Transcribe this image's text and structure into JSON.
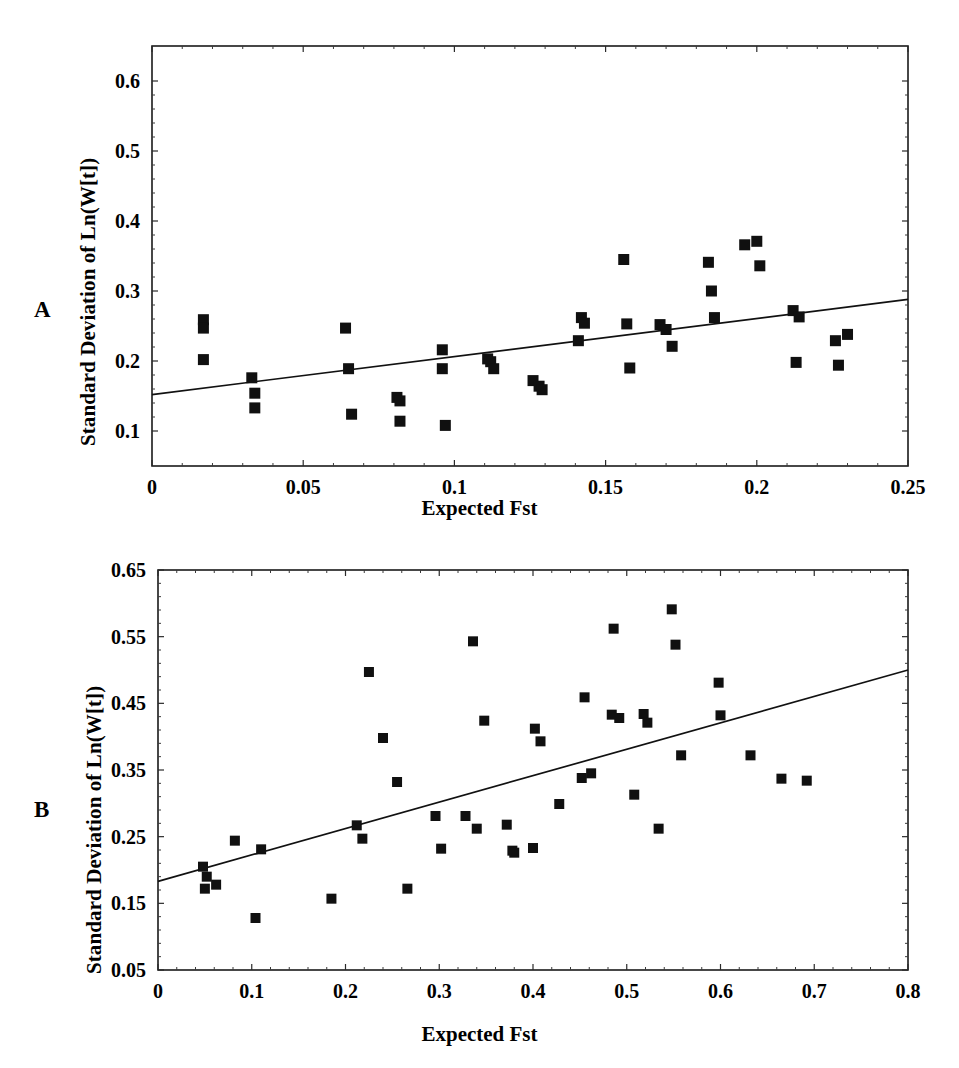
{
  "figure": {
    "panels": [
      {
        "letter": "A",
        "id": "panel-a"
      },
      {
        "letter": "B",
        "id": "panel-b"
      }
    ]
  },
  "chart_data": [
    {
      "type": "scatter",
      "panel_label": "A",
      "title": "",
      "xlabel": "Expected Fst",
      "ylabel": "Standard Deviation of Ln(W[t])",
      "xlim": [
        0,
        0.25
      ],
      "ylim": [
        0.05,
        0.65
      ],
      "xticks": [
        "0",
        "0.05",
        "0.1",
        "0.15",
        "0.2",
        "0.25"
      ],
      "xtick_values": [
        0,
        0.05,
        0.1,
        0.15,
        0.2,
        0.25
      ],
      "yticks": [
        "0.1",
        "0.2",
        "0.3",
        "0.4",
        "0.5",
        "0.6"
      ],
      "ytick_values": [
        0.1,
        0.2,
        0.3,
        0.4,
        0.5,
        0.6
      ],
      "grid": false,
      "legend": "none",
      "marker": "filled-square",
      "trendline": {
        "x": [
          0,
          0.25
        ],
        "y": [
          0.152,
          0.288
        ]
      },
      "points": [
        {
          "x": 0.017,
          "y": 0.259
        },
        {
          "x": 0.017,
          "y": 0.247
        },
        {
          "x": 0.017,
          "y": 0.202
        },
        {
          "x": 0.033,
          "y": 0.176
        },
        {
          "x": 0.034,
          "y": 0.154
        },
        {
          "x": 0.034,
          "y": 0.133
        },
        {
          "x": 0.064,
          "y": 0.247
        },
        {
          "x": 0.065,
          "y": 0.189
        },
        {
          "x": 0.066,
          "y": 0.124
        },
        {
          "x": 0.081,
          "y": 0.148
        },
        {
          "x": 0.082,
          "y": 0.143
        },
        {
          "x": 0.082,
          "y": 0.114
        },
        {
          "x": 0.096,
          "y": 0.216
        },
        {
          "x": 0.096,
          "y": 0.189
        },
        {
          "x": 0.097,
          "y": 0.108
        },
        {
          "x": 0.111,
          "y": 0.203
        },
        {
          "x": 0.112,
          "y": 0.199
        },
        {
          "x": 0.113,
          "y": 0.189
        },
        {
          "x": 0.126,
          "y": 0.172
        },
        {
          "x": 0.128,
          "y": 0.164
        },
        {
          "x": 0.129,
          "y": 0.159
        },
        {
          "x": 0.141,
          "y": 0.229
        },
        {
          "x": 0.142,
          "y": 0.262
        },
        {
          "x": 0.143,
          "y": 0.254
        },
        {
          "x": 0.156,
          "y": 0.345
        },
        {
          "x": 0.157,
          "y": 0.253
        },
        {
          "x": 0.158,
          "y": 0.19
        },
        {
          "x": 0.168,
          "y": 0.252
        },
        {
          "x": 0.17,
          "y": 0.245
        },
        {
          "x": 0.172,
          "y": 0.221
        },
        {
          "x": 0.184,
          "y": 0.341
        },
        {
          "x": 0.185,
          "y": 0.3
        },
        {
          "x": 0.186,
          "y": 0.262
        },
        {
          "x": 0.196,
          "y": 0.366
        },
        {
          "x": 0.2,
          "y": 0.371
        },
        {
          "x": 0.201,
          "y": 0.336
        },
        {
          "x": 0.212,
          "y": 0.272
        },
        {
          "x": 0.214,
          "y": 0.263
        },
        {
          "x": 0.213,
          "y": 0.198
        },
        {
          "x": 0.226,
          "y": 0.229
        },
        {
          "x": 0.227,
          "y": 0.194
        },
        {
          "x": 0.23,
          "y": 0.238
        }
      ]
    },
    {
      "type": "scatter",
      "panel_label": "B",
      "title": "",
      "xlabel": "Expected Fst",
      "ylabel": "Standard Deviation of Ln(W[t])",
      "xlim": [
        0,
        0.8
      ],
      "ylim": [
        0.05,
        0.65
      ],
      "xticks": [
        "0",
        "0.1",
        "0.2",
        "0.3",
        "0.4",
        "0.5",
        "0.6",
        "0.7",
        "0.8"
      ],
      "xtick_values": [
        0,
        0.1,
        0.2,
        0.3,
        0.4,
        0.5,
        0.6,
        0.7,
        0.8
      ],
      "yticks": [
        "0.05",
        "0.15",
        "0.25",
        "0.35",
        "0.45",
        "0.55",
        "0.65"
      ],
      "ytick_values": [
        0.05,
        0.15,
        0.25,
        0.35,
        0.45,
        0.55,
        0.65
      ],
      "grid": false,
      "legend": "none",
      "marker": "filled-square",
      "trendline": {
        "x": [
          0,
          0.8
        ],
        "y": [
          0.183,
          0.5
        ]
      },
      "points": [
        {
          "x": 0.048,
          "y": 0.205
        },
        {
          "x": 0.052,
          "y": 0.19
        },
        {
          "x": 0.05,
          "y": 0.172
        },
        {
          "x": 0.062,
          "y": 0.178
        },
        {
          "x": 0.082,
          "y": 0.244
        },
        {
          "x": 0.104,
          "y": 0.128
        },
        {
          "x": 0.11,
          "y": 0.231
        },
        {
          "x": 0.185,
          "y": 0.157
        },
        {
          "x": 0.212,
          "y": 0.267
        },
        {
          "x": 0.218,
          "y": 0.247
        },
        {
          "x": 0.225,
          "y": 0.497
        },
        {
          "x": 0.24,
          "y": 0.398
        },
        {
          "x": 0.255,
          "y": 0.332
        },
        {
          "x": 0.266,
          "y": 0.172
        },
        {
          "x": 0.296,
          "y": 0.281
        },
        {
          "x": 0.302,
          "y": 0.232
        },
        {
          "x": 0.328,
          "y": 0.281
        },
        {
          "x": 0.336,
          "y": 0.543
        },
        {
          "x": 0.34,
          "y": 0.262
        },
        {
          "x": 0.348,
          "y": 0.424
        },
        {
          "x": 0.372,
          "y": 0.268
        },
        {
          "x": 0.378,
          "y": 0.229
        },
        {
          "x": 0.38,
          "y": 0.226
        },
        {
          "x": 0.4,
          "y": 0.233
        },
        {
          "x": 0.402,
          "y": 0.412
        },
        {
          "x": 0.408,
          "y": 0.393
        },
        {
          "x": 0.428,
          "y": 0.299
        },
        {
          "x": 0.452,
          "y": 0.338
        },
        {
          "x": 0.455,
          "y": 0.459
        },
        {
          "x": 0.462,
          "y": 0.345
        },
        {
          "x": 0.484,
          "y": 0.433
        },
        {
          "x": 0.486,
          "y": 0.562
        },
        {
          "x": 0.492,
          "y": 0.428
        },
        {
          "x": 0.508,
          "y": 0.313
        },
        {
          "x": 0.518,
          "y": 0.434
        },
        {
          "x": 0.522,
          "y": 0.421
        },
        {
          "x": 0.534,
          "y": 0.262
        },
        {
          "x": 0.548,
          "y": 0.591
        },
        {
          "x": 0.552,
          "y": 0.538
        },
        {
          "x": 0.558,
          "y": 0.372
        },
        {
          "x": 0.598,
          "y": 0.481
        },
        {
          "x": 0.6,
          "y": 0.432
        },
        {
          "x": 0.632,
          "y": 0.372
        },
        {
          "x": 0.665,
          "y": 0.337
        },
        {
          "x": 0.692,
          "y": 0.334
        }
      ]
    }
  ]
}
